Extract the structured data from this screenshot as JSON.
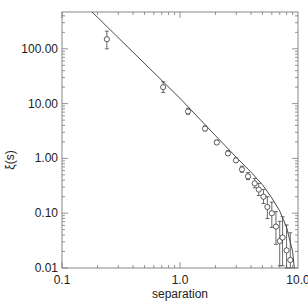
{
  "chart_data": {
    "type": "scatter",
    "title": "",
    "xlabel": "separation",
    "ylabel": "ξ(s)",
    "xscale": "log",
    "yscale": "log",
    "xlim": [
      0.1,
      10.0
    ],
    "ylim": [
      0.01,
      470
    ],
    "grid": false,
    "legend": null,
    "x_ticks": [
      "0.1",
      "1.0",
      "10.0"
    ],
    "y_ticks": [
      "0.01",
      "0.10",
      "1.00",
      "10.00",
      "100.00"
    ],
    "series": [
      {
        "name": "data",
        "marker": "open-circle",
        "x": [
          0.24,
          0.72,
          1.17,
          1.63,
          2.05,
          2.55,
          2.98,
          3.35,
          3.77,
          4.3,
          4.65,
          5.1,
          5.5,
          6.0,
          6.5,
          7.0,
          7.4,
          8.0,
          8.6
        ],
        "y": [
          150,
          20,
          7.2,
          3.5,
          1.95,
          1.23,
          0.92,
          0.63,
          0.47,
          0.35,
          0.27,
          0.2,
          0.13,
          0.1,
          0.057,
          0.031,
          0.036,
          0.021,
          0.014
        ],
        "yerr_low": [
          50,
          4,
          0.8,
          0.3,
          0.15,
          0.1,
          0.08,
          0.07,
          0.06,
          0.06,
          0.06,
          0.05,
          0.05,
          0.045,
          0.03,
          0.02,
          0.025,
          0.012,
          0.008
        ],
        "yerr_high": [
          60,
          5,
          1,
          0.4,
          0.2,
          0.15,
          0.1,
          0.09,
          0.08,
          0.08,
          0.08,
          0.07,
          0.07,
          0.06,
          0.05,
          0.04,
          0.05,
          0.04,
          0.03
        ]
      },
      {
        "name": "fit",
        "type": "line",
        "x": [
          0.18,
          1.0,
          2.0,
          3.0,
          4.0,
          5.0,
          6.0,
          7.0,
          8.0,
          9.0,
          9.3
        ],
        "y": [
          470,
          12.5,
          2.6,
          1.05,
          0.56,
          0.33,
          0.19,
          0.11,
          0.055,
          0.02,
          0.01
        ]
      }
    ]
  }
}
